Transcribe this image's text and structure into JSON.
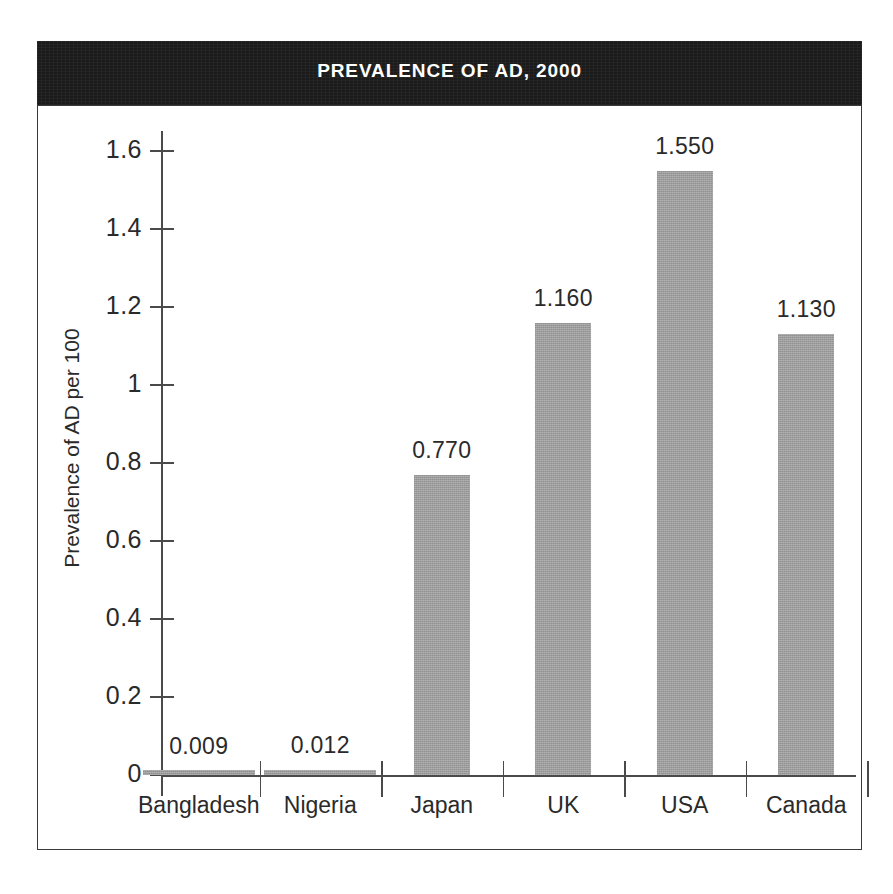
{
  "chart_data": {
    "type": "bar",
    "title": "PREVALENCE OF AD, 2000",
    "xlabel": "",
    "ylabel": "Prevalence of AD per 100",
    "categories": [
      "Bangladesh",
      "Nigeria",
      "Japan",
      "UK",
      "USA",
      "Canada"
    ],
    "values": [
      0.009,
      0.012,
      0.77,
      1.16,
      1.55,
      1.13
    ],
    "value_labels": [
      "0.009",
      "0.012",
      "0.770",
      "1.160",
      "1.550",
      "1.130"
    ],
    "ylim": [
      0,
      1.65
    ],
    "yticks": [
      0,
      0.2,
      0.4,
      0.6,
      0.8,
      1,
      1.2,
      1.4,
      1.6
    ],
    "ytick_labels": [
      "0",
      "0.2",
      "0.4",
      "0.6",
      "0.8",
      "1",
      "1.2",
      "1.4",
      "1.6"
    ],
    "grid": false,
    "legend": false,
    "legend_position": "none",
    "series": [
      {
        "name": "Prevalence of AD per 100",
        "values": [
          0.009,
          0.012,
          0.77,
          1.16,
          1.55,
          1.13
        ]
      }
    ]
  },
  "style": {
    "bar_color": "#9c9c9c",
    "banner_color": "#1b1b1b",
    "banner_text_color": "#ffffff",
    "axis_color": "#4a4a4a",
    "text_color": "#2a2a2a",
    "background": "#ffffff"
  }
}
